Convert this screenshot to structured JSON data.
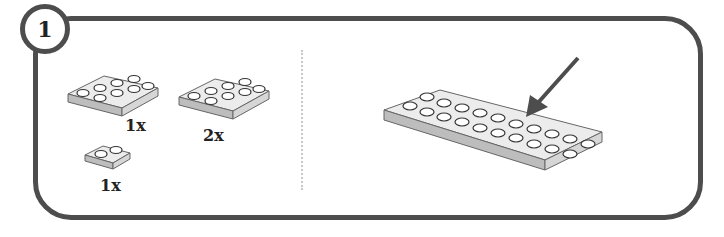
{
  "step": {
    "number": "1"
  },
  "parts": [
    {
      "name": "plate-2x4",
      "quantity": "1x"
    },
    {
      "name": "plate-2x4",
      "quantity": "2x"
    },
    {
      "name": "plate-1x2",
      "quantity": "1x"
    }
  ],
  "assembly": {
    "name": "plate-2x10",
    "arrow": "arrow-pointing-to-placement"
  },
  "colors": {
    "frame": "#4d4d4d",
    "brick": "#e6e6e6",
    "divider": "#c9c9c9"
  }
}
